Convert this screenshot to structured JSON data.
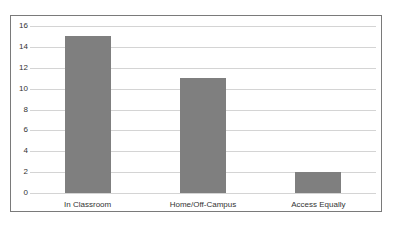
{
  "chart_data": {
    "type": "bar",
    "title": "",
    "xlabel": "",
    "ylabel": "",
    "categories": [
      "In Classroom",
      "Home/Off-Campus",
      "Access Equally"
    ],
    "values": [
      15,
      11,
      2
    ],
    "ylim": [
      0,
      16
    ],
    "yticks": [
      0,
      2,
      4,
      6,
      8,
      10,
      12,
      14,
      16
    ],
    "ytick_labels": [
      "0",
      "2",
      "4",
      "6",
      "8",
      "10",
      "12",
      "14",
      "16"
    ],
    "grid": true,
    "legend": null,
    "colors": {
      "bar": "#7f7f7f",
      "grid": "#d4d4d4",
      "frame": "#7a7a7a"
    }
  }
}
